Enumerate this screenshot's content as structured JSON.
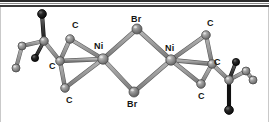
{
  "figure": {
    "kind": "crystal-structure-diagram",
    "caption_labels": [
      "C",
      "Br",
      "C",
      "Ni",
      "Ni",
      "C",
      "C",
      "Br"
    ],
    "background_color": "#ffffff",
    "rule_color": "#2b2b2b"
  },
  "chart_data": {
    "type": "scatter",
    "title": "",
    "xlabel": "",
    "ylabel": "",
    "grid": false,
    "legend": "none",
    "xlim": [
      0,
      269
    ],
    "ylim": [
      0,
      122
    ],
    "palette": {
      "metal_gray": "#8e8e8e",
      "metal_gray_edge": "#5d5d5d",
      "bromine_gray": "#7c7c7c",
      "carbon_gray": "#919191",
      "dark_atom": "#1a1a1a",
      "bond_gray": "#9a9a9a",
      "bond_gray_dark": "#6f6f6f",
      "label_black": "#141414"
    },
    "atoms": [
      {
        "id": "Ni1",
        "element": "Ni",
        "x": 103,
        "y": 59,
        "r": 5.2,
        "shade": "metal_gray"
      },
      {
        "id": "Ni2",
        "element": "Ni",
        "x": 171,
        "y": 60,
        "r": 5.2,
        "shade": "metal_gray"
      },
      {
        "id": "Br1",
        "element": "Br",
        "x": 137,
        "y": 29,
        "r": 5.0,
        "shade": "bromine_gray"
      },
      {
        "id": "Br2",
        "element": "Br",
        "x": 134,
        "y": 92,
        "r": 5.0,
        "shade": "bromine_gray"
      },
      {
        "id": "C1",
        "element": "C",
        "x": 70,
        "y": 39,
        "r": 4.3,
        "shade": "carbon_gray"
      },
      {
        "id": "C2",
        "element": "C",
        "x": 60,
        "y": 61,
        "r": 4.3,
        "shade": "carbon_gray"
      },
      {
        "id": "C3",
        "element": "C",
        "x": 65,
        "y": 88,
        "r": 4.3,
        "shade": "carbon_gray"
      },
      {
        "id": "C4",
        "element": "C",
        "x": 206,
        "y": 35,
        "r": 4.3,
        "shade": "carbon_gray"
      },
      {
        "id": "C5",
        "element": "C",
        "x": 212,
        "y": 64,
        "r": 4.3,
        "shade": "carbon_gray"
      },
      {
        "id": "C6",
        "element": "C",
        "x": 201,
        "y": 84,
        "r": 4.3,
        "shade": "carbon_gray"
      },
      {
        "id": "L1",
        "element": "C",
        "x": 44,
        "y": 41,
        "r": 4.3,
        "shade": "carbon_gray"
      },
      {
        "id": "L2",
        "element": "C",
        "x": 22,
        "y": 46,
        "r": 4.0,
        "shade": "carbon_gray"
      },
      {
        "id": "L3",
        "element": "C",
        "x": 16,
        "y": 68,
        "r": 4.0,
        "shade": "carbon_gray"
      },
      {
        "id": "LD1",
        "element": "X",
        "x": 42,
        "y": 14,
        "r": 4.4,
        "shade": "dark_atom"
      },
      {
        "id": "LD2",
        "element": "X",
        "x": 35,
        "y": 58,
        "r": 3.6,
        "shade": "dark_atom"
      },
      {
        "id": "R1",
        "element": "C",
        "x": 229,
        "y": 80,
        "r": 4.3,
        "shade": "carbon_gray"
      },
      {
        "id": "R2",
        "element": "C",
        "x": 246,
        "y": 71,
        "r": 4.0,
        "shade": "carbon_gray"
      },
      {
        "id": "R3",
        "element": "C",
        "x": 253,
        "y": 80,
        "r": 4.0,
        "shade": "carbon_gray"
      },
      {
        "id": "RD1",
        "element": "X",
        "x": 229,
        "y": 110,
        "r": 4.4,
        "shade": "dark_atom"
      },
      {
        "id": "RD2",
        "element": "X",
        "x": 236,
        "y": 62,
        "r": 3.6,
        "shade": "dark_atom"
      }
    ],
    "bonds": [
      {
        "from": "Ni1",
        "to": "Br1",
        "w": 3.4
      },
      {
        "from": "Ni1",
        "to": "Br2",
        "w": 3.4
      },
      {
        "from": "Ni2",
        "to": "Br1",
        "w": 3.4
      },
      {
        "from": "Ni2",
        "to": "Br2",
        "w": 3.4
      },
      {
        "from": "Ni1",
        "to": "C1",
        "w": 3.2
      },
      {
        "from": "Ni1",
        "to": "C2",
        "w": 3.2
      },
      {
        "from": "Ni1",
        "to": "C3",
        "w": 3.2
      },
      {
        "from": "C1",
        "to": "C2",
        "w": 3.2
      },
      {
        "from": "C2",
        "to": "C3",
        "w": 3.2
      },
      {
        "from": "Ni2",
        "to": "C4",
        "w": 3.2
      },
      {
        "from": "Ni2",
        "to": "C5",
        "w": 3.2
      },
      {
        "from": "Ni2",
        "to": "C6",
        "w": 3.2
      },
      {
        "from": "C4",
        "to": "C5",
        "w": 3.2
      },
      {
        "from": "C5",
        "to": "C6",
        "w": 3.2
      },
      {
        "from": "C2",
        "to": "L1",
        "w": 3.2
      },
      {
        "from": "L1",
        "to": "L2",
        "w": 3.0
      },
      {
        "from": "L2",
        "to": "L3",
        "w": 3.0
      },
      {
        "from": "L1",
        "to": "LD1",
        "w": 3.0
      },
      {
        "from": "L1",
        "to": "LD2",
        "w": 2.6
      },
      {
        "from": "C5",
        "to": "R1",
        "w": 3.2
      },
      {
        "from": "R1",
        "to": "R2",
        "w": 3.0
      },
      {
        "from": "R2",
        "to": "R3",
        "w": 3.0
      },
      {
        "from": "R1",
        "to": "RD1",
        "w": 3.0
      },
      {
        "from": "R1",
        "to": "RD2",
        "w": 2.6
      }
    ],
    "labels": [
      {
        "text": "C",
        "x": 72,
        "y": 21
      },
      {
        "text": "Br",
        "x": 131,
        "y": 15
      },
      {
        "text": "C",
        "x": 207,
        "y": 19
      },
      {
        "text": "Ni",
        "x": 94,
        "y": 42
      },
      {
        "text": "Ni",
        "x": 165,
        "y": 44
      },
      {
        "text": "C",
        "x": 49,
        "y": 62
      },
      {
        "text": "C",
        "x": 214,
        "y": 58
      },
      {
        "text": "C",
        "x": 66,
        "y": 96
      },
      {
        "text": "C",
        "x": 198,
        "y": 92
      },
      {
        "text": "Br",
        "x": 127,
        "y": 100
      }
    ]
  }
}
